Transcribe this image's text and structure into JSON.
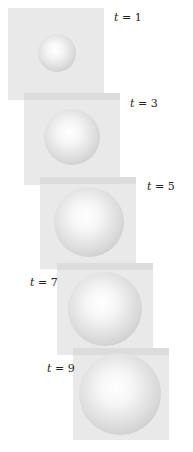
{
  "figure": {
    "panels": [
      {
        "label_var": "t",
        "label_eq": "=",
        "label_val": "1"
      },
      {
        "label_var": "t",
        "label_eq": "=",
        "label_val": "3"
      },
      {
        "label_var": "t",
        "label_eq": "=",
        "label_val": "5"
      },
      {
        "label_var": "t",
        "label_eq": "=",
        "label_val": "7"
      },
      {
        "label_var": "t",
        "label_eq": "=",
        "label_val": "9"
      }
    ],
    "colors": {
      "panel_background": "#e9e9e9",
      "sphere_highlight": "#ffffff",
      "sphere_shadow": "#b9b9b9"
    }
  }
}
